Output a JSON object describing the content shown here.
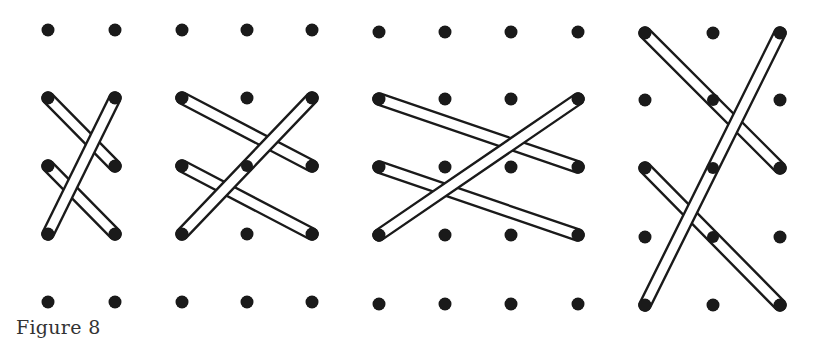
{
  "caption": "Figure 8",
  "style": {
    "dot_color": "#1a1a1a",
    "rod_stroke": "#1a1a1a",
    "rod_fill": "#ffffff",
    "dot_radius": 6.5,
    "rod_width": 11
  },
  "panels": [
    {
      "id": "panel-1",
      "columns": 2,
      "rows": 5,
      "xs": [
        48,
        115
      ],
      "ys": [
        30,
        98,
        166,
        234,
        302
      ],
      "rods": [
        {
          "from": [
            0,
            1
          ],
          "to": [
            1,
            2
          ]
        },
        {
          "from": [
            0,
            2
          ],
          "to": [
            1,
            3
          ]
        },
        {
          "from": [
            1,
            1
          ],
          "to": [
            0,
            3
          ]
        }
      ]
    },
    {
      "id": "panel-2",
      "columns": 3,
      "rows": 5,
      "xs": [
        182,
        247,
        312
      ],
      "ys": [
        30,
        98,
        166,
        234,
        302
      ],
      "rods": [
        {
          "from": [
            0,
            1
          ],
          "to": [
            2,
            2
          ]
        },
        {
          "from": [
            0,
            2
          ],
          "to": [
            2,
            3
          ]
        },
        {
          "from": [
            2,
            1
          ],
          "to": [
            0,
            3
          ]
        }
      ]
    },
    {
      "id": "panel-3",
      "columns": 4,
      "rows": 5,
      "xs": [
        379,
        445,
        511,
        578
      ],
      "ys": [
        32,
        99,
        167,
        235,
        304
      ],
      "rods": [
        {
          "from": [
            0,
            1
          ],
          "to": [
            3,
            2
          ]
        },
        {
          "from": [
            0,
            2
          ],
          "to": [
            3,
            3
          ]
        },
        {
          "from": [
            3,
            1
          ],
          "to": [
            0,
            3
          ]
        }
      ]
    },
    {
      "id": "panel-4",
      "columns": 3,
      "rows": 5,
      "xs": [
        645,
        713,
        780
      ],
      "ys": [
        33,
        100,
        168,
        237,
        305
      ],
      "rods": [
        {
          "from": [
            0,
            0
          ],
          "to": [
            2,
            2
          ]
        },
        {
          "from": [
            0,
            2
          ],
          "to": [
            2,
            4
          ]
        },
        {
          "from": [
            2,
            0
          ],
          "to": [
            0,
            4
          ]
        }
      ]
    }
  ]
}
